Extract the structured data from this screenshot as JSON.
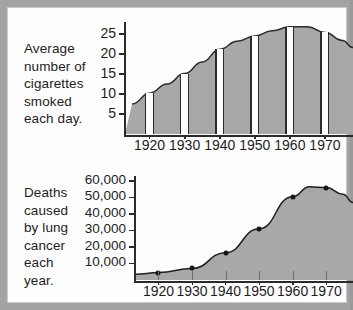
{
  "figure": {
    "background_color": "#fdfdfd",
    "page_gutter_color": "#a3a3a3",
    "ink_color": "#1d1d1d",
    "area_fill_color": "#a8a8a8"
  },
  "charts": [
    {
      "id": "cigarettes",
      "caption": "Average number of cigarettes smoked each day.",
      "caption_lines": [
        "Average",
        "number of",
        "cigarettes",
        "smoked",
        "each day."
      ]
    },
    {
      "id": "lung-cancer-deaths",
      "caption": "Deaths caused by lung cancer each year.",
      "caption_lines": [
        "Deaths",
        "caused",
        "by lung",
        "cancer",
        "each",
        "year."
      ]
    }
  ],
  "chart_data": [
    {
      "type": "area",
      "id": "cigarettes",
      "title": "Average number of cigarettes smoked each day.",
      "xlabel": "",
      "ylabel": "Average number of cigarettes smoked each day.",
      "x": [
        1915,
        1920,
        1925,
        1930,
        1935,
        1940,
        1945,
        1950,
        1955,
        1960,
        1965,
        1970,
        1975,
        1978
      ],
      "values": [
        7.5,
        10.2,
        12.5,
        15.1,
        18.0,
        21.2,
        23.2,
        24.5,
        25.8,
        26.8,
        26.8,
        25.4,
        23.4,
        21.6
      ],
      "ytick_labels": [
        "5",
        "10",
        "15",
        "20",
        "25"
      ],
      "ytick_values": [
        5,
        10,
        15,
        20,
        25
      ],
      "ylim": [
        0,
        28
      ],
      "xtick_labels": [
        "1920",
        "1930",
        "1940",
        "1950",
        "1960",
        "1970"
      ],
      "xtick_values": [
        1920,
        1930,
        1940,
        1950,
        1960,
        1970
      ],
      "xlim": [
        1913,
        1978
      ],
      "grid": false,
      "legend": "none",
      "marker_decades": [
        1920,
        1930,
        1940,
        1950,
        1960,
        1970
      ],
      "marker_values": [
        10.2,
        15.1,
        21.2,
        24.5,
        26.8,
        25.4
      ],
      "style_note": "grey filled area with white vertical bars at each decade"
    },
    {
      "type": "area",
      "id": "lung-cancer-deaths",
      "title": "Deaths caused by lung cancer each year.",
      "xlabel": "",
      "ylabel": "Deaths caused by lung cancer each year.",
      "x": [
        1913,
        1920,
        1930,
        1940,
        1950,
        1960,
        1965,
        1970,
        1975,
        1978
      ],
      "values": [
        3500,
        4500,
        7000,
        16500,
        31000,
        50500,
        56500,
        56000,
        52000,
        47000
      ],
      "data_points": [
        {
          "x": 1920,
          "y": 4500
        },
        {
          "x": 1930,
          "y": 7000
        },
        {
          "x": 1940,
          "y": 16500
        },
        {
          "x": 1950,
          "y": 31000
        },
        {
          "x": 1960,
          "y": 50500
        },
        {
          "x": 1970,
          "y": 56000
        }
      ],
      "ytick_labels": [
        "10,000",
        "20,000",
        "30,000",
        "40,000",
        "50,000",
        "60,000"
      ],
      "ytick_values": [
        10000,
        20000,
        30000,
        40000,
        50000,
        60000
      ],
      "ylim": [
        0,
        63000
      ],
      "xtick_labels": [
        "1920",
        "1930",
        "1940",
        "1950",
        "1960",
        "1970"
      ],
      "xtick_values": [
        1920,
        1930,
        1940,
        1950,
        1960,
        1970
      ],
      "xlim": [
        1913,
        1978
      ],
      "grid": false,
      "legend": "none",
      "style_note": "grey filled area under a smooth curve with round black markers at decades"
    }
  ]
}
